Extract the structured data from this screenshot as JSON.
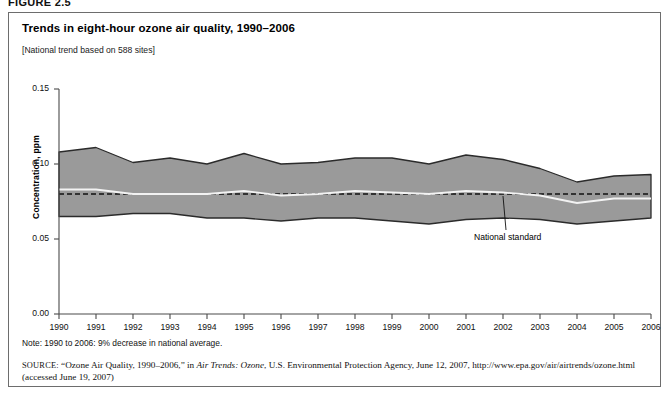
{
  "figure": {
    "label": "FIGURE 2.5",
    "title": "Trends in eight-hour ozone air quality, 1990–2006",
    "subtitle": "[National trend based on 588 sites]",
    "note": "Note: 1990 to 2006: 9% decrease in national average.",
    "source_prefix": "SOURCE:",
    "source_part1": " “Ozone Air Quality, 1990–2006,” in ",
    "source_italic": "Air Trends: Ozone",
    "source_part2": ", U.S. Environmental Protection Agency, June 12, 2007, http://www.epa.gov/air/airtrends/ozone.html (accessed June 19, 2007)"
  },
  "annotations": {
    "national_standard_label": "National standard"
  },
  "colors": {
    "band_fill": "#9a9a9a",
    "band_edge": "#2b2b2b",
    "mean_line": "#f2f2f2",
    "standard_line": "#111111",
    "frame": "#6d6d6d",
    "text": "#111111"
  },
  "chart_data": {
    "type": "area",
    "title": "Trends in eight-hour ozone air quality, 1990–2006",
    "xlabel": "",
    "ylabel": "Concentration, ppm",
    "xlim": [
      1990,
      2006
    ],
    "ylim": [
      0.0,
      0.15
    ],
    "yticks": [
      "0.00",
      "0.05",
      "0.10",
      "0.15"
    ],
    "ytick_values": [
      0.0,
      0.05,
      0.1,
      0.15
    ],
    "grid": false,
    "legend": "none",
    "x": [
      1990,
      1991,
      1992,
      1993,
      1994,
      1995,
      1996,
      1997,
      1998,
      1999,
      2000,
      2001,
      2002,
      2003,
      2004,
      2005,
      2006
    ],
    "categories": [
      "1990",
      "1991",
      "1992",
      "1993",
      "1994",
      "1995",
      "1996",
      "1997",
      "1998",
      "1999",
      "2000",
      "2001",
      "2002",
      "2003",
      "2004",
      "2005",
      "2006"
    ],
    "series": [
      {
        "name": "90th percentile",
        "role": "band_upper",
        "values": [
          0.108,
          0.111,
          0.101,
          0.104,
          0.1,
          0.107,
          0.1,
          0.101,
          0.104,
          0.104,
          0.1,
          0.106,
          0.103,
          0.097,
          0.088,
          0.092,
          0.093
        ]
      },
      {
        "name": "National average (mean)",
        "role": "mean_line",
        "values": [
          0.083,
          0.083,
          0.08,
          0.08,
          0.08,
          0.082,
          0.079,
          0.08,
          0.082,
          0.081,
          0.08,
          0.082,
          0.081,
          0.079,
          0.074,
          0.077,
          0.077
        ]
      },
      {
        "name": "10th percentile",
        "role": "band_lower",
        "values": [
          0.065,
          0.065,
          0.067,
          0.067,
          0.064,
          0.064,
          0.062,
          0.064,
          0.064,
          0.062,
          0.06,
          0.063,
          0.064,
          0.063,
          0.06,
          0.062,
          0.064
        ]
      },
      {
        "name": "National standard",
        "role": "reference_line",
        "style": "dashed",
        "value": 0.08
      }
    ],
    "annotation": {
      "text": "National standard",
      "points_to_year": 2002,
      "points_to_value": 0.08
    }
  }
}
